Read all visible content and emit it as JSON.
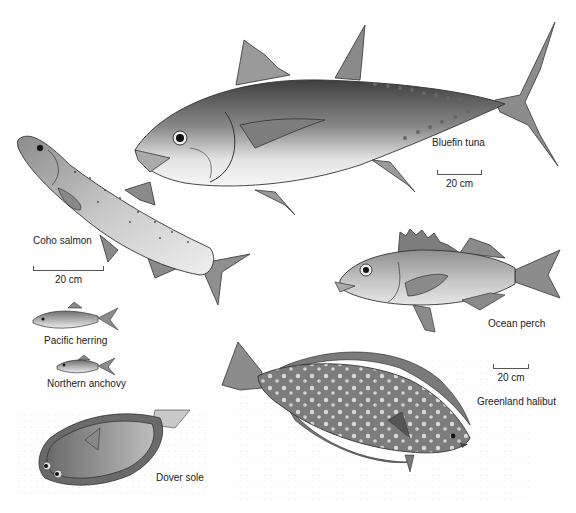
{
  "figure": {
    "species": [
      {
        "id": "bluefin-tuna",
        "label": "Bluefin tuna"
      },
      {
        "id": "coho-salmon",
        "label": "Coho salmon"
      },
      {
        "id": "ocean-perch",
        "label": "Ocean perch"
      },
      {
        "id": "pacific-herring",
        "label": "Pacific herring"
      },
      {
        "id": "northern-anchovy",
        "label": "Northern anchovy"
      },
      {
        "id": "greenland-halibut",
        "label": "Greenland halibut"
      },
      {
        "id": "dover-sole",
        "label": "Dover sole"
      }
    ],
    "scale_bars": [
      {
        "for": "bluefin-tuna",
        "label": "20 cm"
      },
      {
        "for": "coho-salmon",
        "label": "20 cm"
      },
      {
        "for": "ocean-perch",
        "label": "20 cm"
      }
    ]
  },
  "colors": {
    "ink": "#222222",
    "shade_dark": "#5a5a5a",
    "shade_mid": "#9a9a9a",
    "shade_light": "#d8d8d8",
    "background": "#ffffff"
  }
}
